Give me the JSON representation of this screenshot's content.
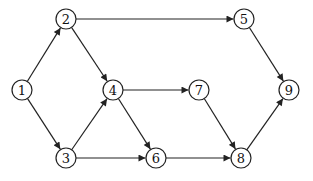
{
  "diagram": {
    "type": "directed-graph",
    "node_radius": 10,
    "colors": {
      "stroke": "#222222",
      "fill": "#ffffff",
      "text": "#111111"
    },
    "nodes": [
      {
        "id": "1",
        "label": "1",
        "x": 22,
        "y": 90
      },
      {
        "id": "2",
        "label": "2",
        "x": 66,
        "y": 19
      },
      {
        "id": "3",
        "label": "3",
        "x": 66,
        "y": 158
      },
      {
        "id": "4",
        "label": "4",
        "x": 113,
        "y": 90
      },
      {
        "id": "5",
        "label": "5",
        "x": 244,
        "y": 19
      },
      {
        "id": "6",
        "label": "6",
        "x": 156,
        "y": 158
      },
      {
        "id": "7",
        "label": "7",
        "x": 199,
        "y": 90
      },
      {
        "id": "8",
        "label": "8",
        "x": 241,
        "y": 158
      },
      {
        "id": "9",
        "label": "9",
        "x": 289,
        "y": 90
      }
    ],
    "edges": [
      {
        "from": "1",
        "to": "2"
      },
      {
        "from": "1",
        "to": "3"
      },
      {
        "from": "2",
        "to": "5"
      },
      {
        "from": "2",
        "to": "4"
      },
      {
        "from": "3",
        "to": "4"
      },
      {
        "from": "3",
        "to": "6"
      },
      {
        "from": "4",
        "to": "7"
      },
      {
        "from": "4",
        "to": "6"
      },
      {
        "from": "5",
        "to": "9"
      },
      {
        "from": "6",
        "to": "8"
      },
      {
        "from": "7",
        "to": "8"
      },
      {
        "from": "8",
        "to": "9"
      }
    ]
  }
}
